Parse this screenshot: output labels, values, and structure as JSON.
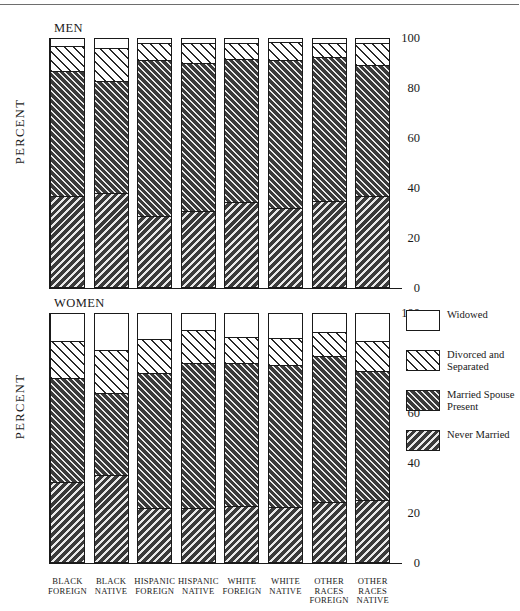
{
  "chart_data": {
    "type": "bar",
    "title": "",
    "subtitle": "",
    "stacked": true,
    "orientation": "vertical",
    "grid": false,
    "legend_position": "right",
    "ylabel": "PERCENT",
    "xlabel": "",
    "ylim": [
      0,
      100
    ],
    "yticks": [
      0,
      20,
      40,
      60,
      80,
      100
    ],
    "ytick_labels": [
      "0",
      "20",
      "40",
      "60",
      "80",
      "100"
    ],
    "categories": [
      "BLACK FOREIGN",
      "BLACK NATIVE",
      "HISPANIC FOREIGN",
      "HISPANIC NATIVE",
      "WHITE FOREIGN",
      "WHITE NATIVE",
      "OTHER RACES FOREIGN",
      "OTHER RACES NATIVE"
    ],
    "series_names": [
      "Never Married",
      "Married Spouse Present",
      "Divorced and Separated",
      "Widowed"
    ],
    "panels": [
      {
        "name": "MEN",
        "series": [
          {
            "name": "Never Married",
            "values": [
              36.8,
              38.0,
              29.0,
              30.8,
              34.4,
              32.0,
              35.0,
              36.8
            ]
          },
          {
            "name": "Married Spouse Present",
            "values": [
              50.2,
              45.0,
              62.4,
              59.4,
              57.4,
              59.2,
              57.6,
              52.4
            ]
          },
          {
            "name": "Divorced and Separated",
            "values": [
              10.0,
              13.0,
              6.6,
              7.8,
              6.2,
              7.2,
              5.4,
              8.8
            ]
          },
          {
            "name": "Widowed",
            "values": [
              3.0,
              4.0,
              2.0,
              2.0,
              2.0,
              1.6,
              2.0,
              2.0
            ]
          }
        ]
      },
      {
        "name": "WOMEN",
        "series": [
          {
            "name": "Never Married",
            "values": [
              32.4,
              35.2,
              22.0,
              22.2,
              22.8,
              22.4,
              24.6,
              25.4
            ]
          },
          {
            "name": "Married Spouse Present",
            "values": [
              41.6,
              32.8,
              54.0,
              58.0,
              57.2,
              56.8,
              58.2,
              51.4
            ]
          },
          {
            "name": "Divorced and Separated",
            "values": [
              15.0,
              17.2,
              13.8,
              13.2,
              10.4,
              10.8,
              9.8,
              12.2
            ]
          },
          {
            "name": "Widowed",
            "values": [
              11.0,
              14.8,
              10.2,
              6.6,
              9.6,
              10.0,
              7.4,
              11.0
            ]
          }
        ]
      }
    ],
    "legend": [
      {
        "label": "Widowed",
        "pattern": "solid-white",
        "key": "widowed"
      },
      {
        "label": "Divorced and\nSeparated",
        "pattern": "light-diagonal-hatch",
        "key": "divorced"
      },
      {
        "label": "Married Spouse\nPresent",
        "pattern": "dense-dark-hatch",
        "key": "married"
      },
      {
        "label": "Never Married",
        "pattern": "reverse-dark-hatch",
        "key": "never"
      }
    ],
    "colors": {
      "ink": "#1a1a1a",
      "background": "#ffffff",
      "hatch_dark": "#3a3a3a",
      "hatch_light": "#e9e9e9"
    }
  },
  "legend_labels": {
    "widowed": "Widowed",
    "divorced_line1": "Divorced and",
    "divorced_line2": "Separated",
    "married_line1": "Married Spouse",
    "married_line2": "Present",
    "never": "Never Married"
  },
  "axis": {
    "ylabel": "PERCENT",
    "t100": "100",
    "t80": "80",
    "t60": "60",
    "t40": "40",
    "t20": "20",
    "t0": "0"
  },
  "panel_titles": {
    "men": "MEN",
    "women": "WOMEN"
  },
  "xlabels": [
    {
      "l1": "BLACK",
      "l2": "FOREIGN",
      "l3": ""
    },
    {
      "l1": "BLACK",
      "l2": "NATIVE",
      "l3": ""
    },
    {
      "l1": "HISPANIC",
      "l2": "FOREIGN",
      "l3": ""
    },
    {
      "l1": "HISPANIC",
      "l2": "NATIVE",
      "l3": ""
    },
    {
      "l1": "WHITE",
      "l2": "FOREIGN",
      "l3": ""
    },
    {
      "l1": "WHITE",
      "l2": "NATIVE",
      "l3": ""
    },
    {
      "l1": "OTHER",
      "l2": "RACES",
      "l3": "FOREIGN"
    },
    {
      "l1": "OTHER",
      "l2": "RACES",
      "l3": "NATIVE"
    }
  ]
}
